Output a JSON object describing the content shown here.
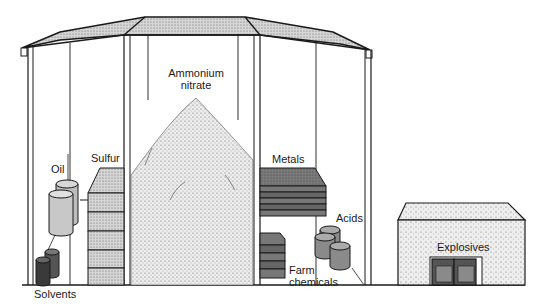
{
  "diagram": {
    "type": "illustration",
    "labels": {
      "ammonium_nitrate_line1": "Ammonium",
      "ammonium_nitrate_line2": "nitrate",
      "oil": "Oil",
      "sulfur": "Sulfur",
      "solvents": "Solvents",
      "metals": "Metals",
      "acids": "Acids",
      "farm_chemicals_line1": "Farm",
      "farm_chemicals_line2": "chemicals",
      "explosives": "Explosives"
    },
    "colors": {
      "line": "#1a1a1a",
      "roof": "#cfcfcf",
      "pile": "#e6e6e6",
      "sulfur": "#c4c4c4",
      "metals": "#6e6e6e",
      "drums_light": "#bdbdbd",
      "drums_mid": "#8a8a8a",
      "drums_dark": "#3a3a3a",
      "shed": "#e2e2e2",
      "background": "#ffffff"
    }
  }
}
